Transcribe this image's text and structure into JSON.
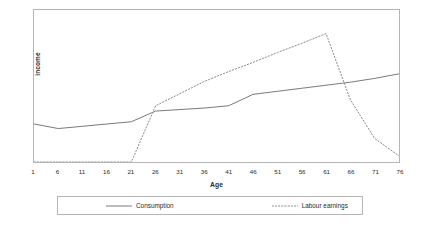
{
  "figure": {
    "title": "",
    "background_color": "#ffffff",
    "frame_color": "#b5b5b5"
  },
  "axes": {
    "x_title": "Age",
    "y_title": "income"
  },
  "legend": {
    "position": "bottom",
    "items": [
      {
        "label": "Consumption",
        "style": "solid",
        "icon": "solid-line-swatch-icon",
        "color": "#7a7a7a"
      },
      {
        "label": "Labour earnings",
        "style": "dotted",
        "icon": "dotted-line-swatch-icon",
        "color": "#8c8c8c"
      }
    ]
  },
  "chart_data": {
    "type": "line",
    "title": "",
    "xlabel": "Age",
    "ylabel": "income",
    "grid": false,
    "legend_position": "bottom",
    "xlim": [
      1,
      76
    ],
    "ylim": [
      0,
      1
    ],
    "x": [
      1,
      6,
      11,
      16,
      21,
      26,
      31,
      36,
      41,
      46,
      51,
      56,
      61,
      66,
      71,
      76
    ],
    "xticklabels": [
      "1",
      "6",
      "11",
      "16",
      "21",
      "26",
      "31",
      "36",
      "41",
      "46",
      "51",
      "56",
      "61",
      "66",
      "71",
      "76"
    ],
    "yticklabels": [],
    "series": [
      {
        "name": "Consumption",
        "style": "solid",
        "color": "#7a7a7a",
        "values": [
          0.25,
          0.22,
          0.235,
          0.25,
          0.265,
          0.335,
          0.345,
          0.355,
          0.37,
          0.445,
          0.465,
          0.485,
          0.505,
          0.525,
          0.55,
          0.58
        ]
      },
      {
        "name": "Labour earnings",
        "style": "dotted",
        "color": "#8c8c8c",
        "values": [
          0.0,
          0.0,
          0.0,
          0.0,
          0.0,
          0.37,
          0.45,
          0.53,
          0.595,
          0.655,
          0.72,
          0.78,
          0.845,
          0.41,
          0.155,
          0.04
        ]
      }
    ]
  }
}
